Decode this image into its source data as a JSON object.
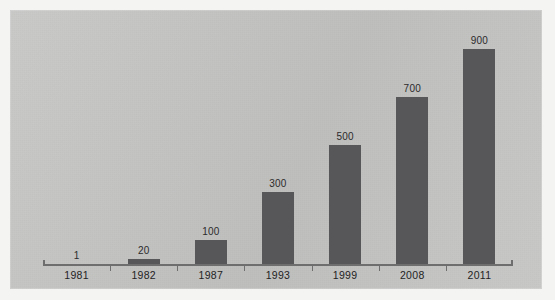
{
  "chart_data": {
    "type": "bar",
    "title": "",
    "subtitle": "",
    "xlabel": "",
    "ylabel": "",
    "categories": [
      "1981",
      "1982",
      "1987",
      "1993",
      "1999",
      "2008",
      "2011"
    ],
    "values": [
      1,
      20,
      100,
      300,
      500,
      700,
      900
    ],
    "value_labels": [
      "1",
      "20",
      "100",
      "300",
      "500",
      "700",
      "900"
    ],
    "ylim": [
      0,
      1000
    ],
    "grid": false,
    "legend": null,
    "axis": {
      "x_axis_visible": true,
      "y_axis_visible": false,
      "tick_marks": "between-categories"
    },
    "series": [
      {
        "name": "",
        "values": [
          1,
          20,
          100,
          300,
          500,
          700,
          900
        ]
      }
    ],
    "annotations": []
  },
  "style": {
    "panel_background": "#c5c5c4",
    "page_background": "#f4f4f3",
    "bar_color": "#57575a",
    "axis_color": "#6e6e6e",
    "label_color": "#232323",
    "value_label_color": "#2b2b2b"
  }
}
